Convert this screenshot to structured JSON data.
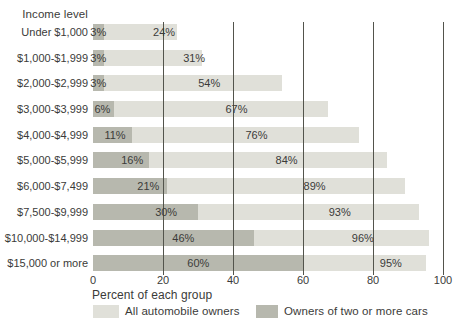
{
  "header": {
    "title": "Income level"
  },
  "axis": {
    "label": "Percent of each group",
    "tick_labels": [
      "0",
      "20",
      "40",
      "60",
      "80",
      "100"
    ]
  },
  "legend": {
    "items": [
      {
        "label": "All automobile owners",
        "color": "#e0e0d9"
      },
      {
        "label": "Owners of two or more cars",
        "color": "#b7b8ae"
      }
    ]
  },
  "chart_data": {
    "type": "bar",
    "orientation": "horizontal",
    "title": "Income level",
    "xlabel": "Percent of each group",
    "xlim": [
      0,
      100
    ],
    "ticks": [
      0,
      20,
      40,
      60,
      80,
      100
    ],
    "gridlines": [
      20,
      40,
      60,
      80,
      100
    ],
    "grid_on": true,
    "legend_position": "bottom",
    "categories": [
      "Under $1,000",
      "$1,000-$1,999",
      "$2,000-$2,999",
      "$3,000-$3,999",
      "$4,000-$4,999",
      "$5,000-$5,999",
      "$6,000-$7,499",
      "$7,500-$9,999",
      "$10,000-$14,999",
      "$15,000 or more"
    ],
    "series": [
      {
        "name": "All automobile owners",
        "values": [
          24,
          31,
          54,
          67,
          76,
          84,
          89,
          93,
          96,
          95
        ],
        "display_values": [
          "24%",
          "31%",
          "54%",
          "67%",
          "76%",
          "84%",
          "89%",
          "93%",
          "96%",
          "95%"
        ],
        "color": "#e0e0d9",
        "label_x": [
          20.3,
          28.9,
          33.2,
          41.0,
          46.7,
          55.3,
          63.3,
          70.5,
          77.1,
          85.1
        ]
      },
      {
        "name": "Owners of two or more cars",
        "values": [
          3,
          3,
          3,
          6,
          11,
          16,
          21,
          30,
          46,
          60
        ],
        "display_values": [
          "3%",
          "3%",
          "3%",
          "6%",
          "11%",
          "16%",
          "21%",
          "30%",
          "46%",
          "60%"
        ],
        "color": "#b7b8ae",
        "label_x": [
          1.5,
          1.5,
          1.5,
          2.7,
          6.3,
          11.2,
          15.8,
          20.9,
          25.8,
          30.1
        ]
      }
    ],
    "colors": {
      "gridline": "#53544c",
      "text": "#3b3b39",
      "background": "#ffffff"
    }
  }
}
